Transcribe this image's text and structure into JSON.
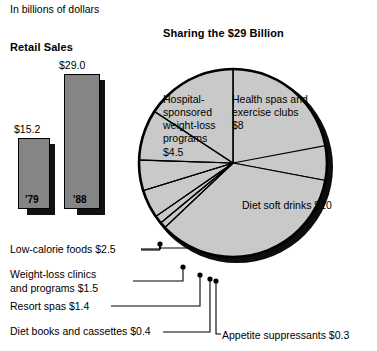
{
  "page": {
    "units_caption": "In billions of dollars"
  },
  "bar_chart": {
    "title": "Retail Sales",
    "bars": [
      {
        "label": "'79",
        "value_label": "$15.2",
        "value": 15.2
      },
      {
        "label": "'88",
        "value_label": "$29.0",
        "value": 29.0
      }
    ]
  },
  "pie_chart": {
    "title": "Sharing the $29 Billion",
    "inside_labels": [
      {
        "name": "hospital",
        "text": "Hospital-\nsponsored\nweight-loss\nprograms\n$4.5"
      },
      {
        "name": "health-spas",
        "text": "Health spas and\nexercise clubs\n$8"
      },
      {
        "name": "diet-soft-drinks",
        "text": "Diet soft drinks $10"
      }
    ],
    "callouts": [
      {
        "name": "low-calorie-foods",
        "text": "Low-calorie foods $2.5"
      },
      {
        "name": "weight-loss-clinics",
        "text": "Weight-loss clinics\nand programs $1.5"
      },
      {
        "name": "resort-spas",
        "text": "Resort spas $1.4"
      },
      {
        "name": "diet-books",
        "text": "Diet books and cassettes $0.4"
      },
      {
        "name": "appetite-suppressants",
        "text": "Appetite suppressants $0.3"
      }
    ]
  },
  "colors": {
    "slice_fill": "#c9c9c9",
    "rim": "#0d0d0d",
    "outline": "#000000",
    "bar_fill": "#858585",
    "bar_shadow": "#111111",
    "background": "#ffffff"
  },
  "chart_data": [
    {
      "type": "bar",
      "title": "Retail Sales",
      "subtitle": "In billions of dollars",
      "categories": [
        "'79",
        "'88"
      ],
      "values": [
        15.2,
        29.0
      ],
      "data_labels": [
        "$15.2",
        "$29.0"
      ],
      "xlabel": "",
      "ylabel": "Billions of dollars",
      "ylim": [
        0,
        31
      ],
      "grid": false,
      "legend": "none"
    },
    {
      "type": "pie",
      "title": "Sharing the $29 Billion",
      "subtitle": "In billions of dollars",
      "unit": "billions of dollars",
      "total": 29,
      "labels": [
        "Health spas and exercise clubs",
        "Diet soft drinks",
        "Appetite suppressants",
        "Diet books and cassettes",
        "Resort spas",
        "Weight-loss clinics and programs",
        "Low-calorie foods",
        "Hospital-sponsored weight-loss programs"
      ],
      "values": [
        8,
        10,
        0.3,
        0.4,
        1.4,
        1.5,
        2.5,
        4.5
      ],
      "data_labels": [
        "$8",
        "$10",
        "$0.3",
        "$0.4",
        "$1.4",
        "$1.5",
        "$2.5",
        "$4.5"
      ],
      "legend": "none",
      "annotations": [
        "Labels for the four smallest wedges are placed outside the pie with leader lines."
      ]
    }
  ]
}
